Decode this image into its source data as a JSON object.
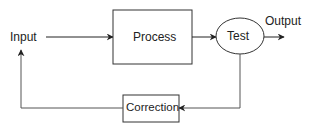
{
  "diagram": {
    "nodes": {
      "input": {
        "label": "Input"
      },
      "process": {
        "label": "Process"
      },
      "test": {
        "label": "Test"
      },
      "output": {
        "label": "Output"
      },
      "correction": {
        "label": "Correction"
      }
    },
    "edges": [
      {
        "from": "Input",
        "to": "Process"
      },
      {
        "from": "Process",
        "to": "Test"
      },
      {
        "from": "Test",
        "to": "Output"
      },
      {
        "from": "Test",
        "to": "Correction"
      },
      {
        "from": "Correction",
        "to": "Input"
      }
    ],
    "colors": {
      "stroke": "#222222",
      "feedback_stroke": "#555555",
      "background": "#ffffff"
    }
  }
}
